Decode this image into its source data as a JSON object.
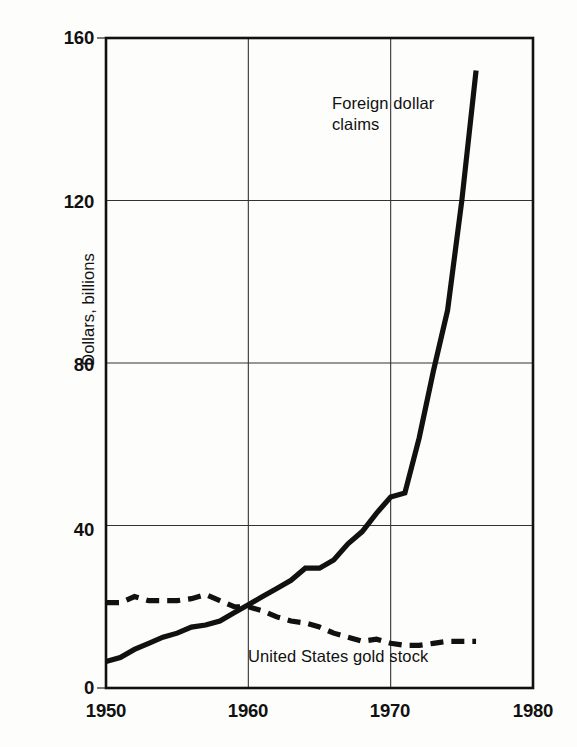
{
  "chart_data": {
    "type": "line",
    "title": "",
    "subtitle": "",
    "xlabel": "",
    "ylabel": "Dollars, billions",
    "xlim": [
      1950,
      1980
    ],
    "ylim": [
      0,
      160
    ],
    "xticks": [
      "1950",
      "1960",
      "1970",
      "1980"
    ],
    "yticks": [
      "0",
      "40",
      "80",
      "120",
      "160"
    ],
    "grid": "major gridlines at y = 40, 80, 120 and x = 1960, 1970",
    "legend_position": "inline annotations next to each curve",
    "annotations": [
      {
        "text": "Foreign dollar claims",
        "near_x": 1966,
        "near_y": 135
      },
      {
        "text": "United States gold stock",
        "near_x": 1966,
        "near_y": 6
      }
    ],
    "series": [
      {
        "name": "Foreign dollar claims",
        "style": "solid",
        "x": [
          1950,
          1951,
          1952,
          1953,
          1954,
          1955,
          1956,
          1957,
          1958,
          1959,
          1960,
          1961,
          1962,
          1963,
          1964,
          1965,
          1966,
          1967,
          1968,
          1969,
          1970,
          1971,
          1972,
          1973,
          1974,
          1975,
          1976
        ],
        "values": [
          6.5,
          7.5,
          9.5,
          11.0,
          12.5,
          13.5,
          15.0,
          15.5,
          16.5,
          18.5,
          20.5,
          22.5,
          24.5,
          26.5,
          29.5,
          29.5,
          31.5,
          35.5,
          38.5,
          43.0,
          47.0,
          48.0,
          61.5,
          78.0,
          93.0,
          120.0,
          152.0
        ]
      },
      {
        "name": "United States gold stock",
        "style": "dashed",
        "x": [
          1950,
          1951,
          1952,
          1953,
          1954,
          1955,
          1956,
          1957,
          1958,
          1959,
          1960,
          1961,
          1962,
          1963,
          1964,
          1965,
          1966,
          1967,
          1968,
          1969,
          1970,
          1971,
          1972,
          1973,
          1974,
          1975,
          1976
        ],
        "values": [
          21.0,
          21.0,
          22.5,
          21.5,
          21.5,
          21.5,
          22.0,
          23.0,
          21.5,
          20.0,
          20.0,
          19.0,
          17.5,
          16.5,
          16.0,
          15.0,
          13.5,
          12.5,
          11.5,
          12.0,
          11.0,
          10.5,
          10.5,
          11.0,
          11.5,
          11.5,
          11.5
        ]
      }
    ]
  },
  "axis": {
    "ylabel": "Dollars, billions",
    "yticks": [
      {
        "label": "160",
        "value": 160
      },
      {
        "label": "120",
        "value": 120
      },
      {
        "label": "80",
        "value": 80
      },
      {
        "label": "40",
        "value": 40
      },
      {
        "label": "0",
        "value": 0
      }
    ],
    "xticks": [
      {
        "label": "1950",
        "value": 1950
      },
      {
        "label": "1960",
        "value": 1960
      },
      {
        "label": "1970",
        "value": 1970
      },
      {
        "label": "1980",
        "value": 1980
      }
    ]
  },
  "labels": {
    "foreign_line1": "Foreign dollar",
    "foreign_line2": "claims",
    "gold": "United States gold stock"
  },
  "colors": {
    "ink": "#111111",
    "grid": "#333333",
    "background": "#fdfdfb"
  }
}
